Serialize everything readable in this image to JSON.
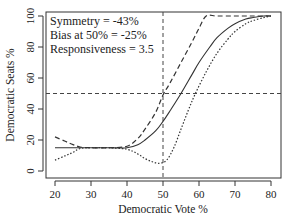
{
  "chart_data": {
    "type": "line",
    "title": "",
    "xlabel": "Democratic Vote %",
    "ylabel": "Democratic Seats %",
    "xlim": [
      18,
      83
    ],
    "ylim": [
      -6,
      103
    ],
    "xticks": [
      20,
      30,
      40,
      50,
      60,
      70,
      80
    ],
    "yticks": [
      0,
      20,
      40,
      60,
      80,
      100
    ],
    "annotations": [
      "Symmetry = -43%",
      "Bias at 50% = -25%",
      "Responsiveness = 3.5"
    ],
    "reference_lines": {
      "vertical_x": 50,
      "horizontal_y": 50
    },
    "grid": false,
    "legend": "none",
    "series": [
      {
        "name": "estimate",
        "style": "solid",
        "x": [
          20,
          25,
          30,
          35,
          40,
          43,
          45,
          48,
          50,
          52,
          55,
          58,
          60,
          63,
          65,
          68,
          70,
          73,
          75,
          78,
          80
        ],
        "y": [
          15,
          15,
          15,
          15,
          15,
          17,
          20,
          26,
          32,
          39,
          50,
          62,
          70,
          80,
          86,
          92,
          95,
          98,
          99,
          100,
          100
        ]
      },
      {
        "name": "upper bound",
        "style": "dashed",
        "x": [
          20,
          23,
          25,
          27,
          30,
          35,
          40,
          43,
          45,
          48,
          50,
          52,
          55,
          58,
          60,
          62,
          65,
          70,
          75,
          80
        ],
        "y": [
          22,
          19,
          17,
          15.5,
          15,
          15,
          16,
          21,
          27,
          38,
          49,
          57,
          70,
          83,
          92,
          100,
          100,
          100,
          100,
          100
        ]
      },
      {
        "name": "lower bound",
        "style": "dotted",
        "x": [
          20,
          23,
          25,
          27,
          30,
          35,
          40,
          43,
          45,
          47,
          49,
          51,
          53,
          55,
          57,
          59,
          62,
          65,
          68,
          70,
          73,
          75,
          78,
          80
        ],
        "y": [
          7,
          10,
          12,
          14.5,
          15,
          15,
          14,
          11,
          8,
          6,
          5,
          7,
          15,
          27,
          39,
          50,
          64,
          76,
          85,
          90,
          95,
          97,
          99,
          100
        ]
      }
    ]
  }
}
